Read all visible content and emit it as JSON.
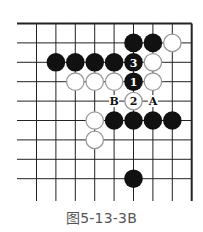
{
  "diagram": {
    "caption": "图5-13-3B",
    "colors": {
      "line": "#222222",
      "black_stone": "#111111",
      "white_stone_fill": "#ffffff",
      "white_stone_edge": "#9a9a9a",
      "label": "#111111"
    },
    "board": {
      "columns": 9,
      "rows": 9,
      "edges": {
        "top": true,
        "right": true,
        "left": false,
        "bottom": false
      }
    },
    "stones": [
      {
        "color": "black",
        "col": 5,
        "row": 1
      },
      {
        "color": "black",
        "col": 6,
        "row": 1
      },
      {
        "color": "white",
        "col": 7,
        "row": 1
      },
      {
        "color": "black",
        "col": 1,
        "row": 2
      },
      {
        "color": "black",
        "col": 2,
        "row": 2
      },
      {
        "color": "black",
        "col": 3,
        "row": 2
      },
      {
        "color": "black",
        "col": 4,
        "row": 2
      },
      {
        "color": "black",
        "col": 5,
        "row": 2,
        "label": "3"
      },
      {
        "color": "white",
        "col": 6,
        "row": 2
      },
      {
        "color": "white",
        "col": 2,
        "row": 3
      },
      {
        "color": "white",
        "col": 3,
        "row": 3
      },
      {
        "color": "white",
        "col": 4,
        "row": 3
      },
      {
        "color": "black",
        "col": 5,
        "row": 3,
        "label": "1"
      },
      {
        "color": "white",
        "col": 6,
        "row": 3
      },
      {
        "color": "white",
        "col": 5,
        "row": 4,
        "label": "2"
      },
      {
        "color": "white",
        "col": 3,
        "row": 5
      },
      {
        "color": "black",
        "col": 4,
        "row": 5
      },
      {
        "color": "black",
        "col": 5,
        "row": 5
      },
      {
        "color": "black",
        "col": 6,
        "row": 5
      },
      {
        "color": "black",
        "col": 7,
        "row": 5
      },
      {
        "color": "white",
        "col": 3,
        "row": 6
      },
      {
        "color": "black",
        "col": 5,
        "row": 8
      }
    ],
    "point_labels": [
      {
        "text": "B",
        "col": 4,
        "row": 4
      },
      {
        "text": "A",
        "col": 6,
        "row": 4
      }
    ]
  }
}
